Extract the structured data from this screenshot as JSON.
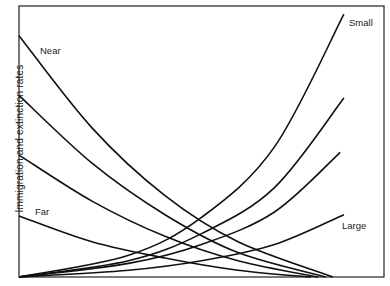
{
  "chart_data": {
    "type": "line",
    "title": "",
    "xlabel": "",
    "ylabel": "Immigration and extinction rates",
    "xlim": [
      0,
      100
    ],
    "ylim": [
      0,
      100
    ],
    "grid": false,
    "legend": "inline labels",
    "series": [
      {
        "name": "Near",
        "kind": "immigration",
        "label": "Near",
        "points": [
          [
            0,
            89
          ],
          [
            20,
            55
          ],
          [
            40,
            30
          ],
          [
            60,
            13
          ],
          [
            86,
            0
          ]
        ]
      },
      {
        "name": "Immigration 2",
        "kind": "immigration",
        "label": "",
        "points": [
          [
            0,
            67
          ],
          [
            20,
            42
          ],
          [
            40,
            23
          ],
          [
            60,
            9
          ],
          [
            84,
            0
          ]
        ]
      },
      {
        "name": "Immigration 3",
        "kind": "immigration",
        "label": "",
        "points": [
          [
            0,
            45
          ],
          [
            20,
            28
          ],
          [
            40,
            15
          ],
          [
            60,
            6
          ],
          [
            82,
            0
          ]
        ]
      },
      {
        "name": "Far",
        "kind": "immigration",
        "label": "Far",
        "points": [
          [
            0,
            22.5
          ],
          [
            20,
            13
          ],
          [
            40,
            7
          ],
          [
            60,
            2.5
          ],
          [
            80,
            0
          ]
        ]
      },
      {
        "name": "Small",
        "kind": "extinction",
        "label": "Small",
        "points": [
          [
            0,
            0
          ],
          [
            30,
            8
          ],
          [
            50,
            22
          ],
          [
            70,
            48
          ],
          [
            89,
            97
          ]
        ]
      },
      {
        "name": "Extinction 2",
        "kind": "extinction",
        "label": "",
        "points": [
          [
            0,
            0
          ],
          [
            30,
            6
          ],
          [
            50,
            16
          ],
          [
            70,
            33
          ],
          [
            89,
            66
          ]
        ]
      },
      {
        "name": "Extinction 3",
        "kind": "extinction",
        "label": "",
        "points": [
          [
            0,
            0
          ],
          [
            30,
            5
          ],
          [
            50,
            12
          ],
          [
            70,
            24
          ],
          [
            88,
            46
          ]
        ]
      },
      {
        "name": "Large",
        "kind": "extinction",
        "label": "Large",
        "points": [
          [
            0,
            0
          ],
          [
            30,
            2.5
          ],
          [
            50,
            6
          ],
          [
            70,
            12
          ],
          [
            89,
            23
          ]
        ]
      }
    ],
    "annotations": [
      "Near",
      "Far",
      "Small",
      "Large"
    ]
  },
  "labels": {
    "ylabel": "Immigration and extinction rates",
    "near": "Near",
    "far": "Far",
    "small": "Small",
    "large": "Large"
  },
  "style": {
    "line_color": "#111111",
    "frame_color": "#222222",
    "background": "#ffffff"
  }
}
